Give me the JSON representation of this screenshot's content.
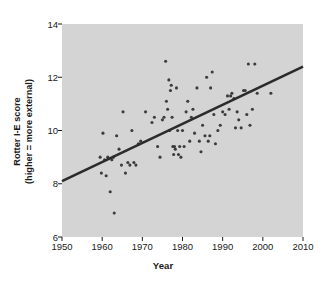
{
  "chart_data": {
    "type": "scatter",
    "title": "",
    "xlabel": "Year",
    "ylabel": "Rotter I-E score\n(higher = more external)",
    "ylabel_line1": "Rotter I-E score",
    "ylabel_line2": "(higher = more external)",
    "xlim": [
      1950,
      2010
    ],
    "ylim": [
      6,
      14
    ],
    "xticks": [
      1950,
      1960,
      1970,
      1980,
      1990,
      2000,
      2010
    ],
    "yticks": [
      6,
      8,
      10,
      12,
      14
    ],
    "grid": false,
    "legend": "none",
    "plot_bgcolor": "#d4d4d4",
    "point_color": "#3b3b3b",
    "line_color": "#2b2b2b",
    "trendline": {
      "type": "linear",
      "x": [
        1950,
        2010
      ],
      "y": [
        8.1,
        12.4
      ],
      "slope": 0.0717,
      "intercept": -131.7
    },
    "points": [
      {
        "x": 1959.5,
        "y": 9.0
      },
      {
        "x": 1959.8,
        "y": 8.4
      },
      {
        "x": 1960.2,
        "y": 9.9
      },
      {
        "x": 1960.6,
        "y": 8.9
      },
      {
        "x": 1961.0,
        "y": 8.3
      },
      {
        "x": 1961.4,
        "y": 9.0
      },
      {
        "x": 1962.0,
        "y": 7.7
      },
      {
        "x": 1962.4,
        "y": 8.9
      },
      {
        "x": 1962.8,
        "y": 9.0
      },
      {
        "x": 1963.0,
        "y": 6.9
      },
      {
        "x": 1963.6,
        "y": 9.8
      },
      {
        "x": 1964.2,
        "y": 9.3
      },
      {
        "x": 1964.8,
        "y": 8.7
      },
      {
        "x": 1965.2,
        "y": 10.7
      },
      {
        "x": 1965.8,
        "y": 8.4
      },
      {
        "x": 1966.4,
        "y": 8.8
      },
      {
        "x": 1966.9,
        "y": 8.7
      },
      {
        "x": 1967.4,
        "y": 10.0
      },
      {
        "x": 1967.9,
        "y": 8.8
      },
      {
        "x": 1968.4,
        "y": 8.7
      },
      {
        "x": 1969.0,
        "y": 9.5
      },
      {
        "x": 1969.6,
        "y": 9.6
      },
      {
        "x": 1970.8,
        "y": 10.7
      },
      {
        "x": 1972.4,
        "y": 10.3
      },
      {
        "x": 1973.0,
        "y": 10.5
      },
      {
        "x": 1973.8,
        "y": 9.4
      },
      {
        "x": 1974.4,
        "y": 9.0
      },
      {
        "x": 1975.0,
        "y": 10.4
      },
      {
        "x": 1975.4,
        "y": 10.5
      },
      {
        "x": 1975.8,
        "y": 12.6
      },
      {
        "x": 1976.0,
        "y": 11.1
      },
      {
        "x": 1976.3,
        "y": 10.8
      },
      {
        "x": 1976.6,
        "y": 11.9
      },
      {
        "x": 1976.8,
        "y": 10.0
      },
      {
        "x": 1977.0,
        "y": 11.5
      },
      {
        "x": 1977.2,
        "y": 11.7
      },
      {
        "x": 1977.4,
        "y": 10.5
      },
      {
        "x": 1977.6,
        "y": 9.4
      },
      {
        "x": 1977.8,
        "y": 9.1
      },
      {
        "x": 1978.0,
        "y": 9.4
      },
      {
        "x": 1978.2,
        "y": 9.3
      },
      {
        "x": 1978.5,
        "y": 11.6
      },
      {
        "x": 1978.8,
        "y": 10.0
      },
      {
        "x": 1979.0,
        "y": 9.1
      },
      {
        "x": 1979.3,
        "y": 9.4
      },
      {
        "x": 1979.6,
        "y": 9.0
      },
      {
        "x": 1980.0,
        "y": 10.0
      },
      {
        "x": 1980.4,
        "y": 9.4
      },
      {
        "x": 1980.9,
        "y": 10.7
      },
      {
        "x": 1981.3,
        "y": 11.1
      },
      {
        "x": 1981.8,
        "y": 9.6
      },
      {
        "x": 1982.2,
        "y": 10.5
      },
      {
        "x": 1982.6,
        "y": 10.8
      },
      {
        "x": 1983.0,
        "y": 9.9
      },
      {
        "x": 1983.6,
        "y": 11.6
      },
      {
        "x": 1984.2,
        "y": 9.6
      },
      {
        "x": 1984.6,
        "y": 9.2
      },
      {
        "x": 1985.0,
        "y": 10.2
      },
      {
        "x": 1985.6,
        "y": 9.8
      },
      {
        "x": 1986.0,
        "y": 12.0
      },
      {
        "x": 1986.4,
        "y": 9.6
      },
      {
        "x": 1986.8,
        "y": 9.8
      },
      {
        "x": 1987.0,
        "y": 11.6
      },
      {
        "x": 1987.4,
        "y": 12.2
      },
      {
        "x": 1987.8,
        "y": 10.6
      },
      {
        "x": 1988.2,
        "y": 9.5
      },
      {
        "x": 1988.8,
        "y": 10.0
      },
      {
        "x": 1989.4,
        "y": 10.2
      },
      {
        "x": 1990.0,
        "y": 10.7
      },
      {
        "x": 1990.6,
        "y": 10.6
      },
      {
        "x": 1991.2,
        "y": 11.3
      },
      {
        "x": 1991.6,
        "y": 10.8
      },
      {
        "x": 1992.0,
        "y": 11.3
      },
      {
        "x": 1992.3,
        "y": 11.4
      },
      {
        "x": 1992.8,
        "y": 11.2
      },
      {
        "x": 1993.2,
        "y": 10.1
      },
      {
        "x": 1993.6,
        "y": 10.7
      },
      {
        "x": 1994.0,
        "y": 10.4
      },
      {
        "x": 1994.6,
        "y": 10.1
      },
      {
        "x": 1995.2,
        "y": 11.5
      },
      {
        "x": 1995.6,
        "y": 11.5
      },
      {
        "x": 1996.0,
        "y": 10.6
      },
      {
        "x": 1996.4,
        "y": 12.5
      },
      {
        "x": 1996.8,
        "y": 10.2
      },
      {
        "x": 1997.4,
        "y": 10.8
      },
      {
        "x": 1998.0,
        "y": 12.5
      },
      {
        "x": 1998.6,
        "y": 11.4
      },
      {
        "x": 2002.0,
        "y": 11.4
      }
    ]
  },
  "axes": {
    "x_tick_labels": [
      "1950",
      "1960",
      "1970",
      "1980",
      "1990",
      "2000",
      "2010"
    ],
    "y_tick_labels": [
      "6",
      "8",
      "10",
      "12",
      "14"
    ],
    "x_title": "Year",
    "y_title_line1": "Rotter I-E score",
    "y_title_line2": "(higher = more external)"
  }
}
